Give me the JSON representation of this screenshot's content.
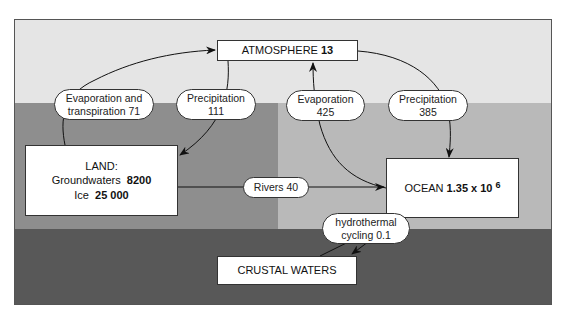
{
  "diagram": {
    "type": "water-cycle-reservoirs-and-fluxes",
    "zones": [
      {
        "name": "atmosphere-zone",
        "color": "#e5e5e5"
      },
      {
        "name": "land-zone",
        "color": "#8e8e8e"
      },
      {
        "name": "ocean-zone",
        "color": "#b9b9b9"
      },
      {
        "name": "crust-zone",
        "color": "#585858"
      }
    ],
    "reservoirs": {
      "atmosphere": {
        "label": "ATMOSPHERE",
        "value": "13"
      },
      "land": {
        "label": "LAND:",
        "groundwaters_label": "Groundwaters",
        "groundwaters_value": "8200",
        "ice_label": "Ice",
        "ice_value": "25 000"
      },
      "ocean": {
        "label": "OCEAN",
        "value": "1.35 x 10",
        "exponent": "6"
      },
      "crust": {
        "label": "CRUSTAL WATERS"
      }
    },
    "fluxes": [
      {
        "id": "evapotranspiration",
        "line1": "Evaporation and",
        "line2": "transpiration 71",
        "from": "land",
        "to": "atmosphere"
      },
      {
        "id": "precip-land",
        "line1": "Precipitation",
        "line2": "111",
        "from": "atmosphere",
        "to": "land"
      },
      {
        "id": "evap-ocean",
        "line1": "Evaporation",
        "line2": "425",
        "from": "ocean",
        "to": "atmosphere"
      },
      {
        "id": "precip-ocean",
        "line1": "Precipitation",
        "line2": "385",
        "from": "atmosphere",
        "to": "ocean"
      },
      {
        "id": "rivers",
        "line1": "Rivers 40",
        "from": "land",
        "to": "ocean"
      },
      {
        "id": "hydrothermal",
        "line1": "hydrothermal",
        "line2": "cycling 0.1",
        "from": "crust",
        "to": "ocean",
        "bidirectional": true
      }
    ]
  }
}
